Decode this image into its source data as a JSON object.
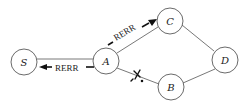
{
  "diagram": {
    "nodes": [
      {
        "id": "S",
        "label": "S",
        "x": 24,
        "y": 62
      },
      {
        "id": "A",
        "label": "A",
        "x": 106,
        "y": 61
      },
      {
        "id": "C",
        "label": "C",
        "x": 170,
        "y": 21
      },
      {
        "id": "D",
        "label": "D",
        "x": 225,
        "y": 60
      },
      {
        "id": "B",
        "label": "B",
        "x": 171,
        "y": 87
      }
    ],
    "edges": [
      {
        "from": "S",
        "to": "A",
        "broken": false
      },
      {
        "from": "A",
        "to": "C",
        "broken": false
      },
      {
        "from": "C",
        "to": "D",
        "broken": false
      },
      {
        "from": "D",
        "to": "B",
        "broken": false
      },
      {
        "from": "A",
        "to": "B",
        "broken": true
      }
    ],
    "messages": [
      {
        "label": "RERR",
        "from": "A",
        "to": "S"
      },
      {
        "label": "RERR",
        "from": "A",
        "to": "C"
      }
    ],
    "break_marker": "X",
    "colors": {
      "line": "#333333",
      "node_fill": "#ffffff",
      "arrow": "#111111"
    }
  }
}
